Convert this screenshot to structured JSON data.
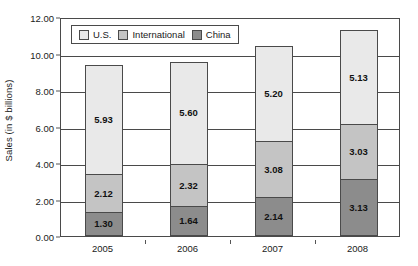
{
  "chart_data": {
    "type": "bar",
    "stacked": true,
    "title": "",
    "subtitle": "",
    "xlabel": "",
    "ylabel": "Sales (in $ billions)",
    "categories": [
      "2005",
      "2006",
      "2007",
      "2008"
    ],
    "ylim": [
      0,
      12
    ],
    "ytick_step": 2,
    "ytick_labels": [
      "0.00",
      "2.00",
      "4.00",
      "6.00",
      "8.00",
      "10.00",
      "12.00"
    ],
    "ytick_values": [
      0,
      2,
      4,
      6,
      8,
      10,
      12
    ],
    "grid": "horizontal",
    "legend_position": "top-left-inside",
    "series": [
      {
        "name": "China",
        "color": "#8c8c8c",
        "values": [
          1.3,
          1.64,
          2.14,
          3.13
        ],
        "labels": [
          "1.30",
          "1.64",
          "2.14",
          "3.13"
        ]
      },
      {
        "name": "International",
        "color": "#c4c4c4",
        "values": [
          2.12,
          2.32,
          3.08,
          3.03
        ],
        "labels": [
          "2.12",
          "2.32",
          "3.08",
          "3.03"
        ]
      },
      {
        "name": "U.S.",
        "color": "#e9e9e9",
        "values": [
          5.93,
          5.6,
          5.2,
          5.13
        ],
        "labels": [
          "5.93",
          "5.60",
          "5.20",
          "5.13"
        ]
      }
    ],
    "stack_order_bottom_to_top": [
      "China",
      "International",
      "U.S."
    ],
    "legend_order": [
      "U.S.",
      "International",
      "China"
    ],
    "totals": [
      9.35,
      9.56,
      10.42,
      11.29
    ]
  },
  "legend": {
    "items": [
      {
        "label": "U.S.",
        "color": "#e9e9e9"
      },
      {
        "label": "International",
        "color": "#c4c4c4"
      },
      {
        "label": "China",
        "color": "#8c8c8c"
      }
    ]
  },
  "axes": {
    "y_title": "Sales (in $ billions)"
  },
  "colors": {
    "axis": "#4a4a4a",
    "gridline": "#4a4a4a",
    "text": "#1a1a1a",
    "background": "#ffffff"
  }
}
